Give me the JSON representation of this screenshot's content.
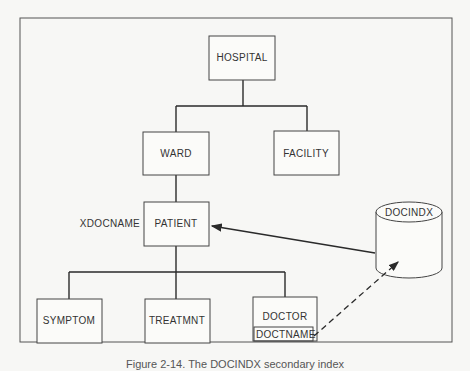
{
  "diagram": {
    "nodes": {
      "hospital": "HOSPITAL",
      "ward": "WARD",
      "facility": "FACILITY",
      "patient": "PATIENT",
      "symptom": "SYMPTOM",
      "treatmnt": "TREATMNT",
      "doctor": "DOCTOR",
      "doctname": "DOCTNAME",
      "docindx": "DOCINDX"
    },
    "labels": {
      "xdocname": "XDOCNAME"
    },
    "edges": [
      {
        "from": "HOSPITAL",
        "to": "WARD",
        "style": "solid"
      },
      {
        "from": "HOSPITAL",
        "to": "FACILITY",
        "style": "solid"
      },
      {
        "from": "WARD",
        "to": "PATIENT",
        "style": "solid"
      },
      {
        "from": "PATIENT",
        "to": "SYMPTOM",
        "style": "solid"
      },
      {
        "from": "PATIENT",
        "to": "TREATMNT",
        "style": "solid"
      },
      {
        "from": "PATIENT",
        "to": "DOCTOR",
        "style": "solid"
      },
      {
        "from": "DOCINDX",
        "to": "PATIENT",
        "style": "solid-arrow"
      },
      {
        "from": "DOCTNAME",
        "to": "DOCINDX",
        "style": "dashed-arrow"
      }
    ]
  },
  "caption": "Figure 2-14. The DOCINDX secondary index"
}
